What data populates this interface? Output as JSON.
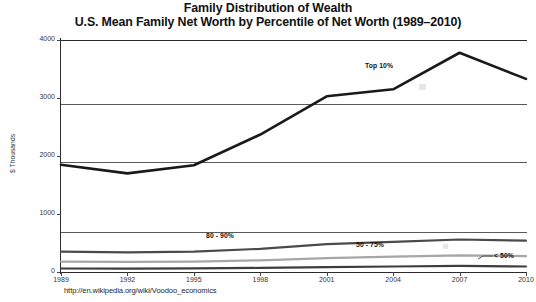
{
  "title": {
    "line1": "Family Distribution of Wealth",
    "line2": "U.S. Mean Family Net Worth by Percentile of Net Worth (1989–2010)"
  },
  "source": {
    "url": "http://en.wikipedia.org/wiki/Voodoo_economics"
  },
  "axes": {
    "ylabel": "$ Thousands",
    "yticks": [
      "4000",
      "3000",
      "2000",
      "1000",
      "0"
    ],
    "xticks": [
      "1989",
      "1992",
      "1995",
      "1998",
      "2001",
      "2004",
      "2007",
      "2010"
    ]
  },
  "series_labels": {
    "top10": "Top 10%",
    "p80_90": "80 - 90%",
    "p50_75": "50 - 75%",
    "lt50": "< 50%"
  },
  "chart_data": {
    "type": "line",
    "xlabel": "",
    "ylabel": "$ Thousands",
    "categories": [
      "1989",
      "1992",
      "1995",
      "1998",
      "2001",
      "2004",
      "2007",
      "2010"
    ],
    "x": [
      1989,
      1992,
      1995,
      1998,
      2001,
      2004,
      2007,
      2010
    ],
    "ylim": [
      0,
      4000
    ],
    "yticks": [
      0,
      1000,
      2000,
      3000,
      4000
    ],
    "grid": true,
    "legend": "inline-annotations",
    "series": [
      {
        "name": "Top 10%",
        "color": "#1a1a1a",
        "width": 2.6,
        "values": [
          1850,
          1700,
          1840,
          2370,
          3030,
          3150,
          3780,
          3330
        ]
      },
      {
        "name": "80 - 90%",
        "color": "#4a4a4a",
        "width": 2.2,
        "values": [
          350,
          340,
          350,
          400,
          480,
          520,
          560,
          540
        ]
      },
      {
        "name": "50 - 75%",
        "color": "#a6a6a6",
        "width": 2.2,
        "values": [
          180,
          175,
          180,
          200,
          240,
          265,
          285,
          275
        ]
      },
      {
        "name": "< 50%",
        "color": "#3d3d3d",
        "width": 2.2,
        "values": [
          60,
          58,
          62,
          70,
          85,
          95,
          105,
          95
        ]
      }
    ]
  }
}
